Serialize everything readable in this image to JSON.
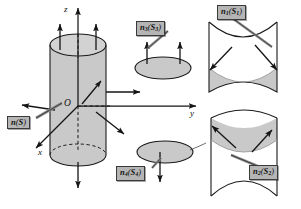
{
  "figure": {
    "background_color": "#ffffff",
    "fill_color": "#c9c9c9",
    "line_color": "#1a1a1a",
    "label_bg_color": "#b5b5b5",
    "label_border_color": "#3a3a3a"
  },
  "axes": {
    "z_label": "z",
    "y_label": "y",
    "x_label": "x",
    "origin_label": "O"
  },
  "labels": {
    "n_S": {
      "vector": "n",
      "sub": "",
      "surface": "S",
      "surface_sub": "",
      "text": "n(S)"
    },
    "n_S1": {
      "vector": "n",
      "sub": "1",
      "surface": "S",
      "surface_sub": "1",
      "text": "n1(S1)"
    },
    "n_S2": {
      "vector": "n",
      "sub": "2",
      "surface": "S",
      "surface_sub": "2",
      "text": "n2(S2)"
    },
    "n_S3": {
      "vector": "n",
      "sub": "3",
      "surface": "S",
      "surface_sub": "3",
      "text": "n3(S3)"
    },
    "n_S4": {
      "vector": "n",
      "sub": "4",
      "surface": "S",
      "surface_sub": "4",
      "text": "n4(S4)"
    }
  },
  "panels": [
    {
      "name": "cylinder-main",
      "caption": "n(S)"
    },
    {
      "name": "top-disk",
      "caption": "n3(S3)"
    },
    {
      "name": "bottom-disk",
      "caption": "n4(S4)"
    },
    {
      "name": "lateral-front",
      "caption": "n1(S1)"
    },
    {
      "name": "lateral-back",
      "caption": "n2(S2)"
    }
  ]
}
